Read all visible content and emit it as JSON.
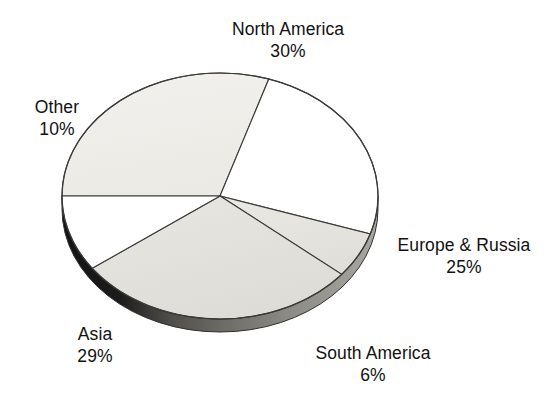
{
  "chart_data": {
    "type": "pie",
    "title": "",
    "subtitle": "",
    "xlabel": "",
    "ylabel": "",
    "legend_position": "none",
    "labels_position": "outside",
    "grid": false,
    "style": "3d-pie",
    "categories": [
      "North America",
      "Europe & Russia",
      "South America",
      "Asia",
      "Other"
    ],
    "values": [
      30,
      25,
      6,
      29,
      10
    ],
    "unit": "%",
    "slices": [
      {
        "name": "North America",
        "value": 30,
        "value_label": "30%",
        "fill": "#efeee9",
        "start_deg": 180,
        "sweep_deg": 108
      },
      {
        "name": "Europe & Russia",
        "value": 25,
        "value_label": "25%",
        "fill": "#ffffff",
        "start_deg": 288,
        "sweep_deg": 90
      },
      {
        "name": "South America",
        "value": 6,
        "value_label": "6%",
        "fill": "#e9e7e2",
        "start_deg": 18,
        "sweep_deg": 21.6
      },
      {
        "name": "Asia",
        "value": 29,
        "value_label": "29%",
        "fill": "#e4e2dd",
        "start_deg": 39.6,
        "sweep_deg": 104.4
      },
      {
        "name": "Other",
        "value": 10,
        "value_label": "10%",
        "fill": "#ffffff",
        "start_deg": 144,
        "sweep_deg": 36
      }
    ],
    "colors": {
      "background": "#ffffff",
      "outline": "#3a3a38",
      "rim_dark": "#1a1a1a",
      "rim_light": "#8f8d88",
      "text": "#111111"
    }
  },
  "labels": {
    "north_america": {
      "name": "North America",
      "value": "30%"
    },
    "other": {
      "name": "Other",
      "value": "10%"
    },
    "europe": {
      "name": "Europe & Russia",
      "value": "25%"
    },
    "south_america": {
      "name": "South America",
      "value": "6%"
    },
    "asia": {
      "name": "Asia",
      "value": "29%"
    }
  }
}
